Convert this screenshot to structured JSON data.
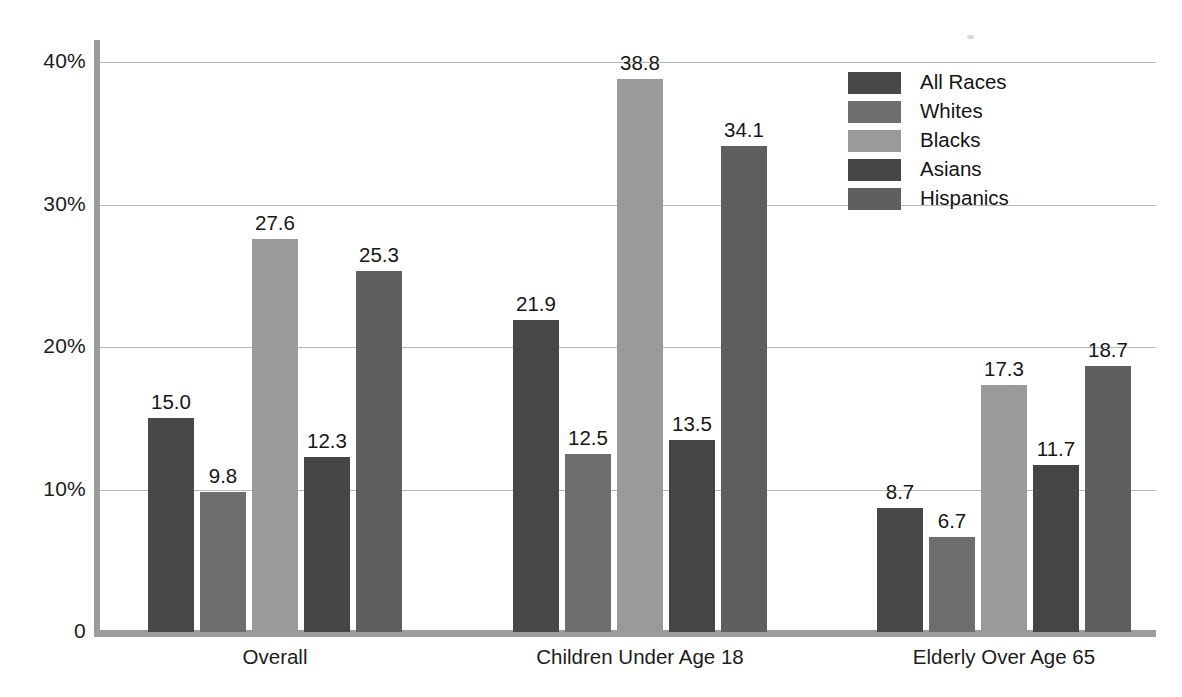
{
  "chart_data": {
    "type": "bar",
    "title": "",
    "subtitle": "",
    "xlabel": "",
    "ylabel": "",
    "categories": [
      "Overall",
      "Children Under Age 18",
      "Elderly Over Age 65"
    ],
    "series": [
      {
        "name": "All Races",
        "color": "#484848",
        "values": [
          15.0,
          21.9,
          8.7
        ],
        "labels": [
          "15.0",
          "21.9",
          "8.7"
        ]
      },
      {
        "name": "Whites",
        "color": "#6e6e6e",
        "values": [
          9.8,
          12.5,
          6.7
        ],
        "labels": [
          "9.8",
          "12.5",
          "6.7"
        ]
      },
      {
        "name": "Blacks",
        "color": "#9a9a9a",
        "values": [
          27.6,
          38.8,
          17.3
        ],
        "labels": [
          "27.6",
          "38.8",
          "17.3"
        ]
      },
      {
        "name": "Asians",
        "color": "#454545",
        "values": [
          12.3,
          13.5,
          11.7
        ],
        "labels": [
          "12.3",
          "13.5",
          "11.7"
        ]
      },
      {
        "name": "Hispanics",
        "color": "#5f5f5f",
        "values": [
          25.3,
          34.1,
          18.7
        ],
        "labels": [
          "25.3",
          "34.1",
          "18.7"
        ]
      }
    ],
    "ylim": [
      0,
      40
    ],
    "yticks": [
      0,
      10,
      20,
      30,
      40
    ],
    "ytick_labels": [
      "0",
      "10%",
      "20%",
      "30%",
      "40%"
    ],
    "grid": "horizontal",
    "legend_position": "top-right",
    "value_labels": true
  },
  "legend": {
    "items": [
      {
        "label": "All Races",
        "color": "#484848"
      },
      {
        "label": "Whites",
        "color": "#6e6e6e"
      },
      {
        "label": "Blacks",
        "color": "#9a9a9a"
      },
      {
        "label": "Asians",
        "color": "#454545"
      },
      {
        "label": "Hispanics",
        "color": "#5f5f5f"
      }
    ]
  }
}
